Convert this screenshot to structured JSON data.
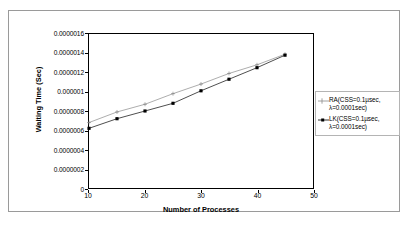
{
  "chart_data": {
    "type": "line",
    "title": "",
    "xlabel": "Number of Processes",
    "ylabel": "Waiting Time (Sec)",
    "xlim": [
      10,
      50
    ],
    "ylim": [
      0,
      1.6e-06
    ],
    "xticks": [
      10,
      20,
      30,
      40,
      50
    ],
    "yticks": [
      0,
      2e-07,
      4e-07,
      6e-07,
      8e-07,
      1e-06,
      1.2e-06,
      1.4e-06,
      1.6e-06
    ],
    "ytick_labels": [
      "0",
      "0.0000002",
      "0.0000004",
      "0.0000006",
      "0.0000008",
      "0.000001",
      "0.0000012",
      "0.0000014",
      "0.0000016"
    ],
    "xtick_labels": [
      "10",
      "20",
      "30",
      "40",
      "50"
    ],
    "grid": false,
    "legend_position": "right",
    "x": [
      10,
      15,
      20,
      25,
      30,
      35,
      40,
      45
    ],
    "series": [
      {
        "name": "RA(CSS=0.1µsec,\nλ=0.0001sec)",
        "marker": "plus",
        "color": "#888888",
        "values": [
          6.8e-07,
          7.9e-07,
          8.7e-07,
          9.8e-07,
          1.08e-06,
          1.19e-06,
          1.28e-06,
          1.39e-06
        ]
      },
      {
        "name": "LK(CSS=0.1µsec,\nλ=0.0001sec)",
        "marker": "square",
        "color": "#000000",
        "values": [
          6.2e-07,
          7.2e-07,
          8e-07,
          8.8e-07,
          1.01e-06,
          1.13e-06,
          1.25e-06,
          1.38e-06
        ]
      }
    ]
  },
  "legend": {
    "entries": [
      {
        "label": "RA(CSS=0.1µsec,\nλ=0.0001sec)"
      },
      {
        "label": "LK(CSS=0.1µsec,\nλ=0.0001sec)"
      }
    ]
  },
  "colors": {
    "series_ra": "#8c8c8c",
    "series_lk": "#000000",
    "axis": "#000000",
    "frame": "#9a9a9a",
    "background": "#ffffff"
  }
}
